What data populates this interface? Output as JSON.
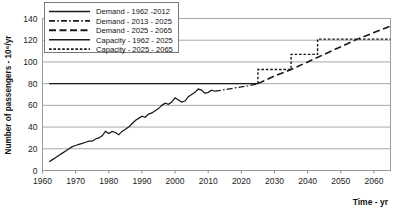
{
  "chart_data": {
    "type": "line",
    "title": "",
    "xlabel": "Time - yr",
    "ylabel": "Number of passengers - 10⁶/yr",
    "xlim": [
      1960,
      2065
    ],
    "ylim": [
      0,
      140
    ],
    "xticks": [
      1960,
      1970,
      1980,
      1990,
      2000,
      2010,
      2020,
      2030,
      2040,
      2050,
      2060
    ],
    "yticks": [
      0,
      20,
      40,
      60,
      80,
      100,
      120,
      140
    ],
    "grid": "horizontal",
    "legend_position": "top-left",
    "series": [
      {
        "name": "Demand - 1962 -2012",
        "style": "solid",
        "color": "#1a1a1a",
        "x": [
          1962,
          1963,
          1964,
          1965,
          1966,
          1967,
          1968,
          1969,
          1970,
          1971,
          1972,
          1973,
          1974,
          1975,
          1976,
          1977,
          1978,
          1979,
          1980,
          1981,
          1982,
          1983,
          1984,
          1985,
          1986,
          1987,
          1988,
          1989,
          1990,
          1991,
          1992,
          1993,
          1994,
          1995,
          1996,
          1997,
          1998,
          1999,
          2000,
          2001,
          2002,
          2003,
          2004,
          2005,
          2006,
          2007,
          2008,
          2009,
          2010,
          2011,
          2012
        ],
        "values": [
          8,
          10,
          12,
          14,
          16,
          18,
          20,
          22,
          23,
          24,
          25,
          26,
          27,
          27,
          29,
          30,
          32,
          36,
          34,
          36,
          35,
          33,
          36,
          38,
          40,
          43,
          46,
          48,
          50,
          49,
          52,
          53,
          55,
          57,
          60,
          62,
          61,
          63,
          67,
          65,
          63,
          64,
          68,
          70,
          72,
          75,
          74,
          71,
          72,
          74,
          73
        ]
      },
      {
        "name": "Demand - 2013 - 2025",
        "style": "dash-dot",
        "color": "#1a1a1a",
        "x": [
          2012,
          2014,
          2016,
          2018,
          2020,
          2022,
          2025
        ],
        "values": [
          73,
          74,
          75,
          76,
          77,
          78,
          80
        ]
      },
      {
        "name": "Demand - 2025 - 2065",
        "style": "long-dash",
        "color": "#1a1a1a",
        "x": [
          2025,
          2030,
          2035,
          2040,
          2045,
          2050,
          2055,
          2060,
          2065
        ],
        "values": [
          80,
          87,
          93,
          100,
          107,
          114,
          121,
          127,
          133
        ]
      },
      {
        "name": "Capacity - 1962 -  2025",
        "style": "solid",
        "color": "#1a1a1a",
        "x": [
          1962,
          2025
        ],
        "values": [
          80,
          80
        ]
      },
      {
        "name": "Capacity - 2025 - 2065",
        "style": "dotted-step",
        "color": "#1a1a1a",
        "steps": [
          {
            "x_start": 2025,
            "x_end": 2035,
            "value": 93
          },
          {
            "x_start": 2035,
            "x_end": 2043,
            "value": 107
          },
          {
            "x_start": 2043,
            "x_end": 2065,
            "value": 121
          }
        ]
      }
    ]
  },
  "axes": {
    "y_axis_title": "Number of passengers - 10⁶/yr",
    "x_axis_title": "Time - yr",
    "y_tick_labels": [
      "140",
      "120",
      "100",
      "80",
      "60",
      "40",
      "20",
      "0"
    ],
    "x_tick_labels": [
      "1960",
      "1970",
      "1980",
      "1990",
      "2000",
      "2010",
      "2020",
      "2030",
      "2040",
      "2050",
      "2060"
    ]
  },
  "legend": {
    "items": [
      {
        "label": "Demand - 1962 -2012",
        "style": "solid"
      },
      {
        "label": "Demand - 2013 - 2025",
        "style": "dash-dot"
      },
      {
        "label": "Demand - 2025 - 2065",
        "style": "long-dash"
      },
      {
        "label": "Capacity - 1962 -  2025",
        "style": "solid"
      },
      {
        "label": "Capacity - 2025 - 2065",
        "style": "dotted"
      }
    ]
  },
  "colors": {
    "line": "#1a1a1a",
    "grid": "#a8a8a8",
    "axis": "#808080",
    "background": "#ffffff"
  }
}
